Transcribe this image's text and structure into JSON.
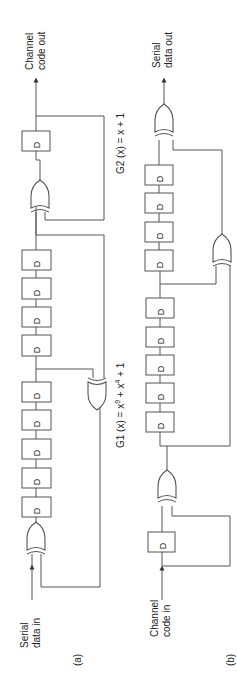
{
  "figure": {
    "panel_a": {
      "caption": "(a)",
      "input_label": [
        "Serial",
        "data in"
      ],
      "output_label": [
        "Channel",
        "code out"
      ],
      "register_label": "D",
      "g1": {
        "label": "G1 (x) = x",
        "exp1": "9",
        "mid": " + x",
        "exp2": "4",
        "tail": " + 1"
      },
      "g2": {
        "label": "G2 (x) = x + 1"
      }
    },
    "panel_b": {
      "caption": "(b)",
      "input_label": [
        "Channel",
        "code in"
      ],
      "output_label": [
        "Serial",
        "data out"
      ],
      "register_label": "D"
    },
    "colors": {
      "line": "#555555",
      "text": "#222222",
      "background": "#ffffff"
    }
  }
}
